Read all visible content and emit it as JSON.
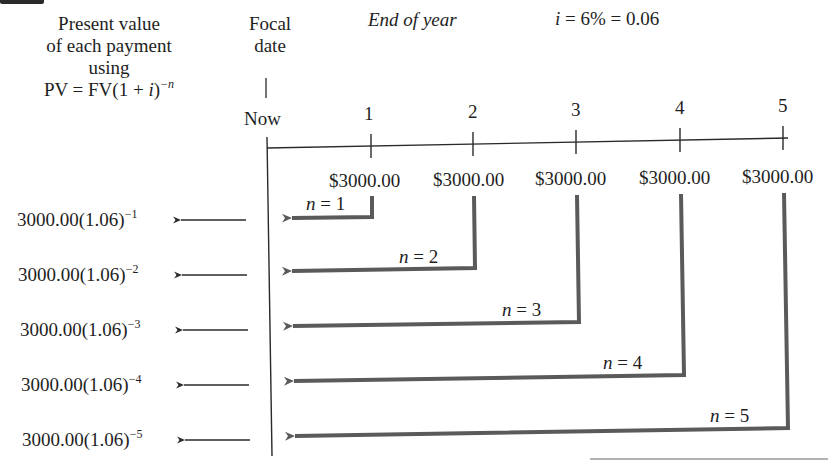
{
  "header": {
    "pv_column_title_lines": [
      "Present value",
      "of each payment",
      "using"
    ],
    "pv_formula": {
      "base": "PV = FV(1 + ",
      "var": "i",
      "close": ")",
      "exponent": "−n"
    },
    "focal_date_lines": [
      "Focal",
      "date"
    ],
    "end_of_year_label": "End of year",
    "rate_label": {
      "var": "i",
      "rest": " = 6% = 0.06"
    }
  },
  "timeline": {
    "origin_label": "Now",
    "ticks": [
      "1",
      "2",
      "3",
      "4",
      "5"
    ],
    "payments": [
      "$3000.00",
      "$3000.00",
      "$3000.00",
      "$3000.00",
      "$3000.00"
    ]
  },
  "rows": [
    {
      "pv_base": "3000.00(1.06)",
      "pv_exp": "−1",
      "n_label_var": "n",
      "n_label_rest": " = 1"
    },
    {
      "pv_base": "3000.00(1.06)",
      "pv_exp": "−2",
      "n_label_var": "n",
      "n_label_rest": " = 2"
    },
    {
      "pv_base": "3000.00(1.06)",
      "pv_exp": "−3",
      "n_label_var": "n",
      "n_label_rest": " = 3"
    },
    {
      "pv_base": "3000.00(1.06)",
      "pv_exp": "−4",
      "n_label_var": "n",
      "n_label_rest": " = 4"
    },
    {
      "pv_base": "3000.00(1.06)",
      "pv_exp": "−5",
      "n_label_var": "n",
      "n_label_rest": " = 5"
    }
  ],
  "colors": {
    "text": "#1e1e1e",
    "timeline": "#2a2a2a",
    "discount_arrow": "#5a5a5a",
    "background": "#ffffff"
  }
}
